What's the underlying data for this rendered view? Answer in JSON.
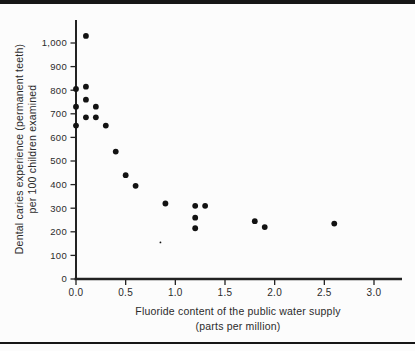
{
  "page": {
    "background": "#fcfcfc",
    "rule_color": "#161616"
  },
  "chart_data": {
    "type": "scatter",
    "title": "",
    "xlabel_line1": "Fluoride content of the public water supply",
    "xlabel_line2": "(parts per million)",
    "ylabel_line1": "Dental caries experience (permanent teeth)",
    "ylabel_line2": "per 100 children examined",
    "xlim": [
      0,
      3.3
    ],
    "ylim": [
      0,
      1100
    ],
    "grid": false,
    "legend": "none",
    "axis_color": "#222222",
    "tick_label_color": "#2b2b2b",
    "point_color": "#121212",
    "x_ticks": [
      {
        "value": 0.0,
        "label": "0.0"
      },
      {
        "value": 0.5,
        "label": "0.5"
      },
      {
        "value": 1.0,
        "label": "1.0"
      },
      {
        "value": 1.5,
        "label": "1.5"
      },
      {
        "value": 2.0,
        "label": "2.0"
      },
      {
        "value": 2.5,
        "label": "2.5"
      },
      {
        "value": 3.0,
        "label": "3.0"
      }
    ],
    "y_ticks": [
      {
        "value": 0,
        "label": "0"
      },
      {
        "value": 100,
        "label": "100"
      },
      {
        "value": 200,
        "label": "200"
      },
      {
        "value": 300,
        "label": "300"
      },
      {
        "value": 400,
        "label": "400"
      },
      {
        "value": 500,
        "label": "500"
      },
      {
        "value": 600,
        "label": "600"
      },
      {
        "value": 700,
        "label": "700"
      },
      {
        "value": 800,
        "label": "800"
      },
      {
        "value": 900,
        "label": "900"
      },
      {
        "value": 1000,
        "label": "1,000"
      }
    ],
    "points": [
      {
        "x": 0.0,
        "y": 805
      },
      {
        "x": 0.0,
        "y": 730
      },
      {
        "x": 0.0,
        "y": 650
      },
      {
        "x": 0.1,
        "y": 1030
      },
      {
        "x": 0.1,
        "y": 815
      },
      {
        "x": 0.1,
        "y": 760
      },
      {
        "x": 0.1,
        "y": 685
      },
      {
        "x": 0.2,
        "y": 730
      },
      {
        "x": 0.2,
        "y": 685
      },
      {
        "x": 0.3,
        "y": 650
      },
      {
        "x": 0.4,
        "y": 540
      },
      {
        "x": 0.5,
        "y": 440
      },
      {
        "x": 0.6,
        "y": 395
      },
      {
        "x": 0.9,
        "y": 320
      },
      {
        "x": 1.2,
        "y": 310
      },
      {
        "x": 1.2,
        "y": 260
      },
      {
        "x": 1.2,
        "y": 215
      },
      {
        "x": 1.3,
        "y": 310
      },
      {
        "x": 1.8,
        "y": 245
      },
      {
        "x": 1.9,
        "y": 220
      },
      {
        "x": 2.6,
        "y": 235
      }
    ],
    "artifact_dot": {
      "x": 0.85,
      "y": 155
    }
  }
}
